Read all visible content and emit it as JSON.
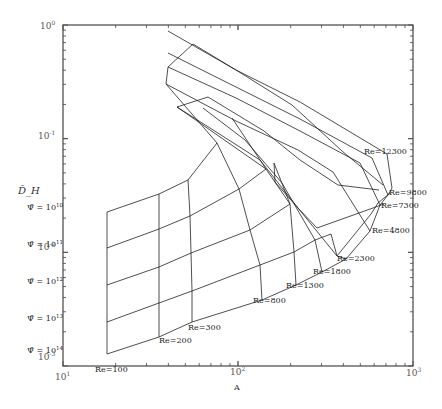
{
  "chart_data": {
    "type": "line",
    "subtype": "carpet-plot",
    "title": "",
    "xlabel": "A",
    "ylabel": "D̄_H",
    "xscale": "log",
    "yscale": "log",
    "xlim": [
      10,
      1000
    ],
    "ylim": [
      0.001,
      1
    ],
    "grid": false,
    "legend": null,
    "x_tick_labels": [
      {
        "base": "10",
        "exp": "1",
        "value": 10
      },
      {
        "base": "10",
        "exp": "2",
        "value": 100
      },
      {
        "base": "10",
        "exp": "3",
        "value": 1000
      }
    ],
    "y_tick_labels": [
      {
        "base": "10",
        "exp": "0",
        "value": 1
      },
      {
        "base": "10",
        "exp": "-1",
        "value": 0.1
      },
      {
        "base": "10",
        "exp": "-2",
        "value": 0.01
      },
      {
        "base": "10",
        "exp": "-3",
        "value": 0.001
      }
    ],
    "psi_labels": [
      {
        "text": "Ψ̄ = 10",
        "exp": "10",
        "x": 27,
        "y": 210
      },
      {
        "text": "Ψ̄ = 10",
        "exp": "11",
        "x": 27,
        "y": 247
      },
      {
        "text": "Ψ̄ = 10",
        "exp": "12",
        "x": 27,
        "y": 284
      },
      {
        "text": "Ψ̄ = 10",
        "exp": "13",
        "x": 27,
        "y": 321
      },
      {
        "text": "Ψ̄ = 10",
        "exp": "14",
        "x": 27,
        "y": 353
      }
    ],
    "re_labels": [
      {
        "text": "Re=100",
        "x": 95,
        "y": 372
      },
      {
        "text": "Re=200",
        "x": 159,
        "y": 343
      },
      {
        "text": "Re=300",
        "x": 188,
        "y": 330
      },
      {
        "text": "Re=800",
        "x": 253,
        "y": 303
      },
      {
        "text": "Re=1300",
        "x": 286,
        "y": 288
      },
      {
        "text": "Re=1800",
        "x": 313,
        "y": 274
      },
      {
        "text": "Re=2300",
        "x": 337,
        "y": 261
      },
      {
        "text": "Re=4800",
        "x": 372,
        "y": 233
      },
      {
        "text": "Re=7300",
        "x": 381,
        "y": 208
      },
      {
        "text": "Re=9800",
        "x": 389,
        "y": 195
      },
      {
        "text": "Re=12300",
        "x": 364,
        "y": 154
      }
    ],
    "psi_series": [
      {
        "name": "Psi=1e10",
        "points": [
          [
            107,
            212
          ],
          [
            159,
            194
          ],
          [
            188,
            180
          ],
          [
            217,
            143
          ],
          [
            166,
            84
          ],
          [
            168,
            67
          ],
          [
            193,
            44
          ],
          [
            236,
            70
          ],
          [
            292,
            105
          ],
          [
            342,
            151
          ],
          [
            383,
            185
          ]
        ]
      },
      {
        "name": "Psi=1e11",
        "points": [
          [
            107,
            248
          ],
          [
            159,
            229
          ],
          [
            190,
            216
          ],
          [
            239,
            189
          ],
          [
            266,
            169
          ],
          [
            177,
            107
          ],
          [
            208,
            97
          ],
          [
            264,
            131
          ],
          [
            300,
            160
          ],
          [
            338,
            185
          ],
          [
            379,
            190
          ]
        ]
      },
      {
        "name": "Psi=1e12",
        "points": [
          [
            107,
            285
          ],
          [
            159,
            267
          ],
          [
            191,
            253
          ],
          [
            250,
            230
          ],
          [
            290,
            204
          ],
          [
            274,
            163
          ],
          [
            275,
            182
          ],
          [
            298,
            208
          ],
          [
            317,
            228
          ],
          [
            359,
            213
          ],
          [
            384,
            204
          ]
        ]
      },
      {
        "name": "Psi=1e13",
        "points": [
          [
            107,
            322
          ],
          [
            159,
            303
          ],
          [
            192,
            291
          ],
          [
            260,
            265
          ],
          [
            294,
            252
          ],
          [
            315,
            240
          ],
          [
            331,
            234
          ],
          [
            337,
            256
          ],
          [
            371,
            214
          ],
          [
            378,
            203
          ],
          [
            390,
            193
          ]
        ]
      },
      {
        "name": "Psi=1e14",
        "points": [
          [
            107,
            354
          ],
          [
            159,
            337
          ],
          [
            192,
            322
          ],
          [
            262,
            300
          ],
          [
            296,
            285
          ],
          [
            322,
            272
          ],
          [
            346,
            259
          ],
          [
            370,
            231
          ],
          [
            380,
            205
          ],
          [
            388,
            195
          ],
          [
            392,
            188
          ]
        ]
      }
    ],
    "re_series": [
      {
        "name": "Re=100",
        "points": [
          [
            107,
            212
          ],
          [
            107,
            248
          ],
          [
            107,
            285
          ],
          [
            107,
            322
          ],
          [
            107,
            354
          ]
        ]
      },
      {
        "name": "Re=200",
        "points": [
          [
            159,
            194
          ],
          [
            159,
            229
          ],
          [
            159,
            267
          ],
          [
            159,
            303
          ],
          [
            159,
            337
          ]
        ]
      },
      {
        "name": "Re=300",
        "points": [
          [
            188,
            180
          ],
          [
            190,
            216
          ],
          [
            191,
            253
          ],
          [
            192,
            291
          ],
          [
            192,
            322
          ]
        ]
      },
      {
        "name": "Re=800",
        "points": [
          [
            217,
            143
          ],
          [
            239,
            189
          ],
          [
            250,
            230
          ],
          [
            260,
            265
          ],
          [
            262,
            300
          ]
        ]
      },
      {
        "name": "Re=1300",
        "points": [
          [
            232,
            118
          ],
          [
            266,
            169
          ],
          [
            290,
            204
          ],
          [
            294,
            252
          ],
          [
            296,
            285
          ]
        ]
      },
      {
        "name": "Re=1800",
        "points": [
          [
            203,
            108
          ],
          [
            245,
            140
          ],
          [
            282,
            183
          ],
          [
            315,
            240
          ],
          [
            322,
            272
          ]
        ]
      },
      {
        "name": "Re=2300",
        "points": [
          [
            177,
            107
          ],
          [
            210,
            128
          ],
          [
            260,
            160
          ],
          [
            298,
            208
          ],
          [
            337,
            256
          ],
          [
            346,
            259
          ]
        ]
      },
      {
        "name": "Re=4800",
        "points": [
          [
            166,
            84
          ],
          [
            236,
            121
          ],
          [
            298,
            150
          ],
          [
            333,
            172
          ],
          [
            370,
            231
          ]
        ]
      },
      {
        "name": "Re=7300",
        "points": [
          [
            168,
            67
          ],
          [
            236,
            98
          ],
          [
            300,
            131
          ],
          [
            360,
            163
          ],
          [
            380,
            205
          ]
        ]
      },
      {
        "name": "Re=9800",
        "points": [
          [
            168,
            53
          ],
          [
            236,
            87
          ],
          [
            300,
            119
          ],
          [
            372,
            158
          ],
          [
            388,
            195
          ]
        ]
      },
      {
        "name": "Re=12300",
        "points": [
          [
            168,
            31
          ],
          [
            236,
            70
          ],
          [
            300,
            102
          ],
          [
            387,
            154
          ],
          [
            392,
            188
          ]
        ]
      }
    ]
  }
}
